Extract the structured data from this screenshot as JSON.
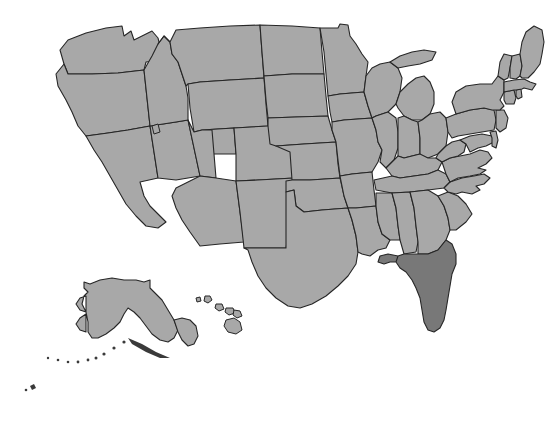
{
  "figure": {
    "type": "choropleth-map",
    "region": "United States",
    "background_color": "#ffffff",
    "width": 551,
    "height": 429
  },
  "legend": {
    "default_fill": "#a8a8a8",
    "highlight_fill": "#787878",
    "border_color": "#262626"
  },
  "map_data": {
    "type": "map",
    "projection": "albers-usa",
    "highlighted_states": [
      "Florida"
    ],
    "states": [
      {
        "name": "Washington",
        "fill": "#a8a8a8"
      },
      {
        "name": "Oregon",
        "fill": "#a8a8a8"
      },
      {
        "name": "California",
        "fill": "#a8a8a8"
      },
      {
        "name": "Nevada",
        "fill": "#a8a8a8"
      },
      {
        "name": "Idaho",
        "fill": "#a8a8a8"
      },
      {
        "name": "Montana",
        "fill": "#a8a8a8"
      },
      {
        "name": "Wyoming",
        "fill": "#a8a8a8"
      },
      {
        "name": "Utah",
        "fill": "#a8a8a8"
      },
      {
        "name": "Arizona",
        "fill": "#a8a8a8"
      },
      {
        "name": "Colorado",
        "fill": "#a8a8a8"
      },
      {
        "name": "New Mexico",
        "fill": "#a8a8a8"
      },
      {
        "name": "North Dakota",
        "fill": "#a8a8a8"
      },
      {
        "name": "South Dakota",
        "fill": "#a8a8a8"
      },
      {
        "name": "Nebraska",
        "fill": "#a8a8a8"
      },
      {
        "name": "Kansas",
        "fill": "#a8a8a8"
      },
      {
        "name": "Oklahoma",
        "fill": "#a8a8a8"
      },
      {
        "name": "Texas",
        "fill": "#a8a8a8"
      },
      {
        "name": "Minnesota",
        "fill": "#a8a8a8"
      },
      {
        "name": "Iowa",
        "fill": "#a8a8a8"
      },
      {
        "name": "Missouri",
        "fill": "#a8a8a8"
      },
      {
        "name": "Arkansas",
        "fill": "#a8a8a8"
      },
      {
        "name": "Louisiana",
        "fill": "#a8a8a8"
      },
      {
        "name": "Wisconsin",
        "fill": "#a8a8a8"
      },
      {
        "name": "Illinois",
        "fill": "#a8a8a8"
      },
      {
        "name": "Michigan",
        "fill": "#a8a8a8"
      },
      {
        "name": "Indiana",
        "fill": "#a8a8a8"
      },
      {
        "name": "Ohio",
        "fill": "#a8a8a8"
      },
      {
        "name": "Kentucky",
        "fill": "#a8a8a8"
      },
      {
        "name": "Tennessee",
        "fill": "#a8a8a8"
      },
      {
        "name": "Mississippi",
        "fill": "#a8a8a8"
      },
      {
        "name": "Alabama",
        "fill": "#a8a8a8"
      },
      {
        "name": "Georgia",
        "fill": "#a8a8a8"
      },
      {
        "name": "Florida",
        "fill": "#787878"
      },
      {
        "name": "South Carolina",
        "fill": "#a8a8a8"
      },
      {
        "name": "North Carolina",
        "fill": "#a8a8a8"
      },
      {
        "name": "Virginia",
        "fill": "#a8a8a8"
      },
      {
        "name": "West Virginia",
        "fill": "#a8a8a8"
      },
      {
        "name": "Maryland",
        "fill": "#a8a8a8"
      },
      {
        "name": "Delaware",
        "fill": "#a8a8a8"
      },
      {
        "name": "Pennsylvania",
        "fill": "#a8a8a8"
      },
      {
        "name": "New Jersey",
        "fill": "#a8a8a8"
      },
      {
        "name": "New York",
        "fill": "#a8a8a8"
      },
      {
        "name": "Connecticut",
        "fill": "#a8a8a8"
      },
      {
        "name": "Rhode Island",
        "fill": "#a8a8a8"
      },
      {
        "name": "Massachusetts",
        "fill": "#a8a8a8"
      },
      {
        "name": "Vermont",
        "fill": "#a8a8a8"
      },
      {
        "name": "New Hampshire",
        "fill": "#a8a8a8"
      },
      {
        "name": "Maine",
        "fill": "#a8a8a8"
      },
      {
        "name": "Alaska",
        "fill": "#a8a8a8"
      },
      {
        "name": "Hawaii",
        "fill": "#a8a8a8"
      }
    ]
  }
}
